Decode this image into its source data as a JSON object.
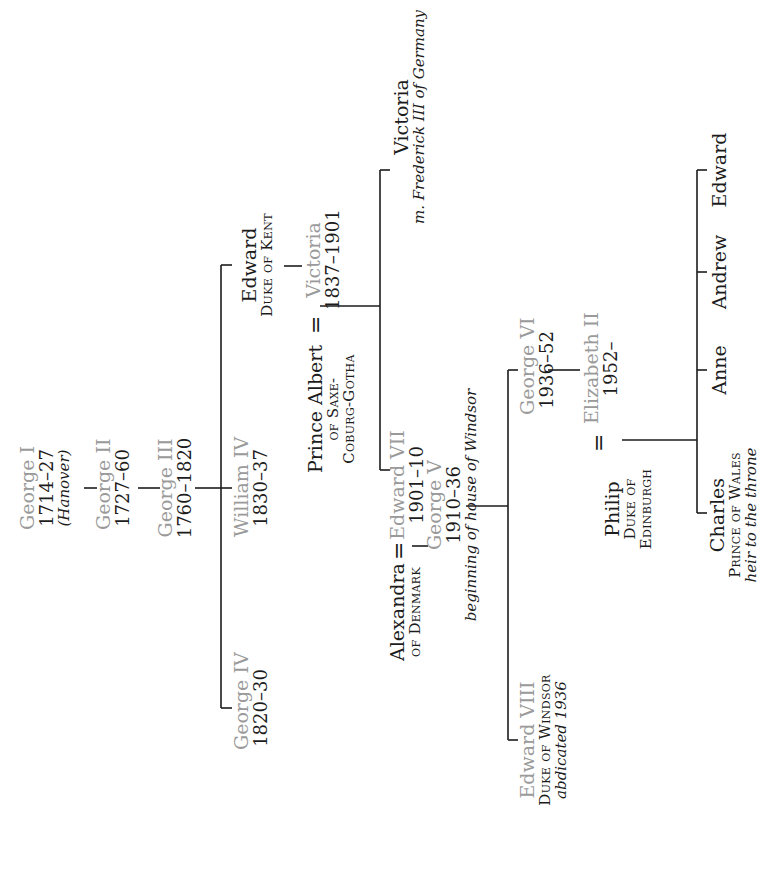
{
  "diagram": {
    "type": "family-tree",
    "orientation": "rotated-90-ccw",
    "colors": {
      "monarch_name": "#9a9a9a",
      "text": "#1c1c1c",
      "line": "#1c1c1c"
    }
  },
  "nodes": {
    "george1": {
      "name": "George I",
      "years": "1714–27",
      "note": "(Hanover)",
      "monarch": true
    },
    "george2": {
      "name": "George II",
      "years": "1727–60",
      "monarch": true
    },
    "george3": {
      "name": "George III",
      "years": "1760–1820",
      "monarch": true
    },
    "george4": {
      "name": "George IV",
      "years": "1820–30",
      "monarch": true
    },
    "william4": {
      "name": "William IV",
      "years": "1830–37",
      "monarch": true
    },
    "edward_kent": {
      "name": "Edward",
      "title": "Duke of Kent",
      "monarch": false
    },
    "albert": {
      "name": "Prince Albert",
      "title1": "of Saxe-",
      "title2": "Coburg-Gotha",
      "monarch": false
    },
    "victoria": {
      "name": "Victoria",
      "years": "1837–1901",
      "monarch": true
    },
    "victoria_daughter": {
      "name": "Victoria",
      "note": "m. Frederick III of Germany",
      "monarch": false
    },
    "alexandra": {
      "name": "Alexandra",
      "title": "of Denmark",
      "monarch": false
    },
    "edward7": {
      "name": "Edward VII",
      "years": "1901–10",
      "monarch": true
    },
    "george5": {
      "name": "George V",
      "years": "1910–36",
      "note": "beginning of house of Windsor",
      "monarch": true
    },
    "edward8": {
      "name": "Edward VIII",
      "title": "Duke of Windsor",
      "note": "abdicated 1936",
      "monarch": true
    },
    "george6": {
      "name": "George VI",
      "years": "1936–52",
      "monarch": true
    },
    "philip": {
      "name": "Philip",
      "title1": "Duke of",
      "title2": "Edinburgh",
      "monarch": false
    },
    "elizabeth2": {
      "name": "Elizabeth II",
      "years": "1952–",
      "monarch": true
    },
    "charles": {
      "name": "Charles",
      "title": "Prince of Wales",
      "note": "heir to the throne",
      "monarch": false
    },
    "anne": {
      "name": "Anne",
      "monarch": false
    },
    "andrew": {
      "name": "Andrew",
      "monarch": false
    },
    "edward_son": {
      "name": "Edward",
      "monarch": false
    }
  },
  "marriages": [
    {
      "a": "albert",
      "b": "victoria",
      "symbol": "="
    },
    {
      "a": "alexandra",
      "b": "edward7",
      "symbol": "="
    },
    {
      "a": "philip",
      "b": "elizabeth2",
      "symbol": "="
    }
  ],
  "edges": [
    [
      "george1",
      "george2"
    ],
    [
      "george2",
      "george3"
    ],
    [
      "george3",
      "george4"
    ],
    [
      "george3",
      "william4"
    ],
    [
      "george3",
      "edward_kent"
    ],
    [
      "edward_kent",
      "victoria"
    ],
    [
      "albert+victoria",
      "edward7"
    ],
    [
      "albert+victoria",
      "victoria_daughter"
    ],
    [
      "alexandra+edward7",
      "george5"
    ],
    [
      "george5",
      "edward8"
    ],
    [
      "george5",
      "george6"
    ],
    [
      "george6",
      "elizabeth2"
    ],
    [
      "philip+elizabeth2",
      "charles"
    ],
    [
      "philip+elizabeth2",
      "anne"
    ],
    [
      "philip+elizabeth2",
      "andrew"
    ],
    [
      "philip+elizabeth2",
      "edward_son"
    ]
  ]
}
